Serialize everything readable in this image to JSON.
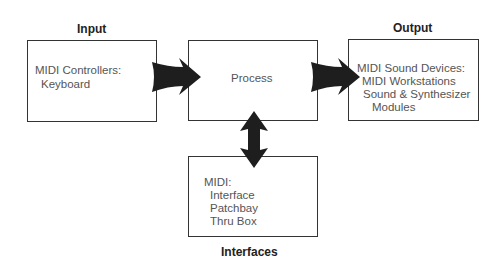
{
  "diagram": {
    "input": {
      "heading": "Input",
      "lines": [
        "MIDI Controllers:",
        "Keyboard"
      ]
    },
    "process": {
      "label": "Process"
    },
    "output": {
      "heading": "Output",
      "lines": [
        "MIDI Sound Devices:",
        "MIDI Workstations",
        "Sound & Synthesizer",
        "Modules"
      ]
    },
    "interfaces": {
      "heading": "Interfaces",
      "lines": [
        "MIDI:",
        "Interface",
        "Patchbay",
        "Thru Box"
      ]
    },
    "arrows": [
      {
        "from": "Input",
        "to": "Process",
        "type": "single"
      },
      {
        "from": "Process",
        "to": "Output",
        "type": "single"
      },
      {
        "from": "Process",
        "to": "Interfaces",
        "type": "double"
      }
    ],
    "colors": {
      "arrow": "#1e1e1e",
      "border": "#333333",
      "text": "#555555"
    }
  }
}
